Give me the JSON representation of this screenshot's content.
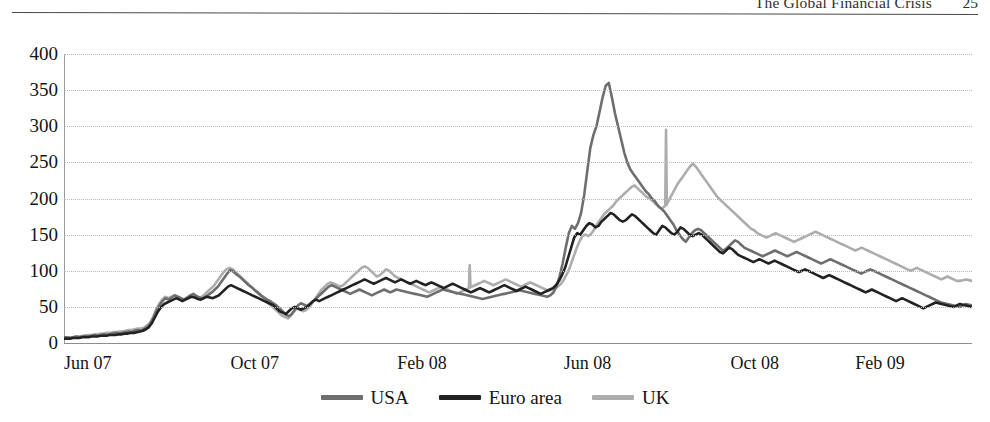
{
  "header": {
    "title": "The Global Financial Crisis",
    "page_number": "25"
  },
  "legend": {
    "position": "bottom-center",
    "items": [
      {
        "label": "USA",
        "color": "#6e6e6e"
      },
      {
        "label": "Euro area",
        "color": "#222222"
      },
      {
        "label": "UK",
        "color": "#adadad"
      }
    ]
  },
  "chart_data": {
    "type": "line",
    "title": "",
    "subtitle": "",
    "xlabel": "",
    "ylabel": "",
    "ylim": [
      0,
      400
    ],
    "yticks": [
      0,
      50,
      100,
      150,
      200,
      250,
      300,
      350,
      400
    ],
    "ytick_labels": [
      "0",
      "50",
      "100",
      "150",
      "200",
      "250",
      "300",
      "350",
      "400"
    ],
    "grid": true,
    "xtick_labels": [
      "Jun 07",
      "Oct 07",
      "Feb 08",
      "Jun 08",
      "Oct 08",
      "Feb 09"
    ],
    "xtick_fractions": [
      0.0,
      0.1835,
      0.367,
      0.5505,
      0.734,
      0.8715
    ],
    "x_range": [
      "Jun 07",
      "May 09"
    ],
    "series": [
      {
        "name": "USA",
        "color": "#6e6e6e",
        "values": [
          8,
          8,
          7,
          8,
          9,
          8,
          9,
          10,
          9,
          10,
          11,
          10,
          11,
          12,
          11,
          12,
          13,
          14,
          13,
          14,
          15,
          16,
          15,
          17,
          18,
          17,
          19,
          22,
          26,
          34,
          44,
          52,
          58,
          62,
          60,
          63,
          66,
          64,
          62,
          60,
          63,
          66,
          68,
          65,
          63,
          61,
          64,
          67,
          70,
          74,
          78,
          84,
          90,
          96,
          101,
          99,
          95,
          92,
          88,
          84,
          80,
          77,
          73,
          70,
          66,
          63,
          60,
          58,
          55,
          52,
          48,
          44,
          40,
          37,
          40,
          46,
          52,
          55,
          53,
          51,
          54,
          58,
          62,
          66,
          70,
          74,
          78,
          80,
          78,
          76,
          74,
          72,
          70,
          68,
          70,
          72,
          74,
          72,
          70,
          68,
          66,
          68,
          70,
          72,
          74,
          72,
          70,
          72,
          74,
          73,
          72,
          71,
          70,
          69,
          68,
          67,
          66,
          65,
          64,
          66,
          68,
          70,
          72,
          74,
          73,
          72,
          71,
          70,
          69,
          68,
          67,
          66,
          65,
          64,
          63,
          62,
          61,
          62,
          63,
          64,
          65,
          66,
          67,
          68,
          69,
          70,
          71,
          72,
          73,
          72,
          71,
          70,
          69,
          68,
          67,
          66,
          65,
          64,
          66,
          70,
          78,
          92,
          110,
          132,
          152,
          162,
          158,
          166,
          180,
          205,
          238,
          270,
          288,
          300,
          320,
          340,
          356,
          360,
          340,
          318,
          300,
          282,
          264,
          250,
          240,
          234,
          228,
          222,
          216,
          210,
          206,
          200,
          196,
          190,
          186,
          182,
          176,
          170,
          164,
          156,
          150,
          144,
          140,
          146,
          152,
          156,
          158,
          156,
          152,
          148,
          144,
          140,
          136,
          132,
          128,
          130,
          134,
          138,
          142,
          140,
          136,
          132,
          130,
          128,
          126,
          124,
          122,
          120,
          122,
          124,
          126,
          128,
          126,
          124,
          122,
          120,
          122,
          124,
          126,
          124,
          122,
          120,
          118,
          116,
          114,
          112,
          110,
          112,
          114,
          116,
          114,
          112,
          110,
          108,
          106,
          104,
          102,
          100,
          98,
          96,
          98,
          100,
          102,
          100,
          98,
          96,
          94,
          92,
          90,
          88,
          86,
          84,
          82,
          80,
          78,
          76,
          74,
          72,
          70,
          68,
          66,
          64,
          62,
          60,
          58,
          56,
          55,
          54,
          53,
          52,
          51,
          50,
          52,
          54,
          53,
          52
        ]
      },
      {
        "name": "Euro area",
        "color": "#222222",
        "values": [
          6,
          6,
          6,
          7,
          7,
          7,
          8,
          8,
          8,
          9,
          9,
          9,
          10,
          10,
          10,
          11,
          11,
          11,
          12,
          12,
          13,
          13,
          14,
          14,
          15,
          16,
          17,
          19,
          22,
          28,
          36,
          44,
          50,
          54,
          56,
          58,
          60,
          62,
          60,
          58,
          60,
          62,
          64,
          63,
          61,
          60,
          62,
          64,
          63,
          62,
          64,
          66,
          70,
          74,
          78,
          80,
          78,
          76,
          74,
          72,
          70,
          68,
          66,
          64,
          62,
          60,
          58,
          56,
          54,
          52,
          48,
          44,
          42,
          40,
          44,
          48,
          50,
          48,
          46,
          48,
          50,
          54,
          58,
          60,
          58,
          60,
          62,
          64,
          66,
          68,
          70,
          72,
          74,
          76,
          78,
          80,
          82,
          84,
          86,
          88,
          86,
          84,
          82,
          84,
          86,
          88,
          90,
          88,
          86,
          84,
          86,
          88,
          86,
          84,
          82,
          84,
          86,
          84,
          82,
          80,
          82,
          84,
          82,
          80,
          78,
          76,
          78,
          80,
          82,
          80,
          78,
          76,
          74,
          72,
          70,
          72,
          74,
          76,
          74,
          72,
          70,
          72,
          74,
          76,
          78,
          80,
          78,
          76,
          74,
          72,
          74,
          76,
          78,
          76,
          74,
          72,
          70,
          68,
          70,
          72,
          74,
          76,
          80,
          86,
          94,
          104,
          118,
          132,
          146,
          152,
          150,
          156,
          162,
          166,
          164,
          160,
          162,
          168,
          172,
          176,
          180,
          178,
          174,
          170,
          168,
          170,
          174,
          178,
          176,
          172,
          168,
          164,
          160,
          156,
          152,
          150,
          156,
          162,
          160,
          156,
          152,
          150,
          154,
          160,
          158,
          154,
          150,
          148,
          150,
          152,
          150,
          146,
          142,
          138,
          134,
          130,
          126,
          124,
          128,
          132,
          130,
          126,
          122,
          120,
          118,
          116,
          114,
          112,
          114,
          116,
          114,
          112,
          110,
          112,
          114,
          112,
          110,
          108,
          106,
          104,
          102,
          100,
          98,
          100,
          102,
          100,
          98,
          96,
          94,
          92,
          90,
          92,
          94,
          92,
          90,
          88,
          86,
          84,
          82,
          80,
          78,
          76,
          74,
          72,
          70,
          72,
          74,
          72,
          70,
          68,
          66,
          64,
          62,
          60,
          58,
          60,
          62,
          60,
          58,
          56,
          54,
          52,
          50,
          48,
          50,
          52,
          54,
          56,
          55,
          54,
          53,
          52,
          51,
          50,
          52,
          54,
          53,
          52,
          51,
          50
        ]
      },
      {
        "name": "UK",
        "color": "#adadad",
        "values": [
          7,
          7,
          8,
          8,
          9,
          9,
          10,
          10,
          11,
          11,
          12,
          12,
          13,
          13,
          14,
          14,
          15,
          15,
          16,
          16,
          17,
          18,
          18,
          19,
          20,
          20,
          21,
          24,
          28,
          36,
          46,
          54,
          60,
          64,
          62,
          64,
          66,
          64,
          62,
          60,
          62,
          64,
          66,
          64,
          62,
          64,
          68,
          72,
          76,
          80,
          86,
          92,
          98,
          102,
          104,
          102,
          98,
          94,
          90,
          86,
          82,
          78,
          74,
          70,
          66,
          62,
          58,
          54,
          50,
          46,
          42,
          38,
          36,
          34,
          38,
          44,
          48,
          46,
          44,
          46,
          50,
          56,
          62,
          68,
          74,
          78,
          82,
          84,
          82,
          80,
          78,
          80,
          84,
          88,
          92,
          96,
          100,
          104,
          106,
          104,
          100,
          96,
          92,
          94,
          98,
          102,
          100,
          96,
          92,
          90,
          88,
          86,
          84,
          82,
          80,
          78,
          76,
          74,
          72,
          70,
          72,
          74,
          76,
          78,
          76,
          74,
          72,
          70,
          68,
          70,
          72,
          74,
          76,
          78,
          80,
          82,
          84,
          86,
          84,
          82,
          80,
          82,
          84,
          86,
          88,
          86,
          84,
          82,
          80,
          78,
          80,
          82,
          84,
          82,
          80,
          78,
          76,
          74,
          72,
          74,
          76,
          78,
          82,
          88,
          96,
          106,
          118,
          130,
          140,
          148,
          150,
          148,
          152,
          158,
          166,
          172,
          178,
          182,
          186,
          190,
          196,
          200,
          204,
          208,
          212,
          216,
          218,
          214,
          210,
          206,
          202,
          200,
          196,
          192,
          188,
          186,
          190,
          196,
          204,
          212,
          220,
          226,
          232,
          238,
          244,
          248,
          244,
          238,
          232,
          226,
          220,
          214,
          208,
          202,
          198,
          194,
          190,
          186,
          182,
          178,
          174,
          170,
          166,
          162,
          158,
          156,
          152,
          150,
          148,
          146,
          148,
          150,
          152,
          150,
          148,
          146,
          144,
          142,
          140,
          142,
          144,
          146,
          148,
          150,
          152,
          154,
          152,
          150,
          148,
          146,
          144,
          142,
          140,
          138,
          136,
          134,
          132,
          130,
          128,
          130,
          132,
          130,
          128,
          126,
          124,
          122,
          120,
          118,
          116,
          114,
          112,
          110,
          108,
          106,
          104,
          102,
          100,
          102,
          104,
          102,
          100,
          98,
          96,
          94,
          92,
          90,
          88,
          90,
          92,
          90,
          88,
          86,
          86,
          87,
          88,
          87,
          86
        ],
        "spikes": [
          {
            "index": 132,
            "value": 108,
            "note": "brief downward/upward spike near Feb 08"
          },
          {
            "index": 196,
            "value": 295,
            "note": "sharp single-day spike near Nov 08"
          }
        ]
      }
    ]
  }
}
